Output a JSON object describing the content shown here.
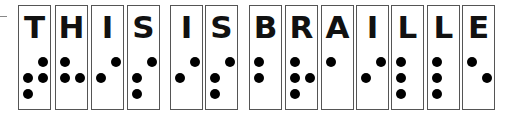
{
  "cells": [
    {
      "letter": "T",
      "left": 18,
      "dots": [
        2,
        3,
        4,
        5
      ]
    },
    {
      "letter": "H",
      "left": 55,
      "dots": [
        1,
        2,
        5
      ]
    },
    {
      "letter": "I",
      "left": 91,
      "dots": [
        2,
        4
      ]
    },
    {
      "letter": "S",
      "left": 127,
      "dots": [
        2,
        3,
        4
      ]
    },
    {
      "letter": "I",
      "left": 170,
      "dots": [
        2,
        4
      ]
    },
    {
      "letter": "S",
      "left": 205,
      "dots": [
        2,
        3,
        4
      ]
    },
    {
      "letter": "B",
      "left": 249,
      "dots": [
        1,
        2
      ]
    },
    {
      "letter": "R",
      "left": 285,
      "dots": [
        1,
        2,
        3,
        5
      ]
    },
    {
      "letter": "A",
      "left": 321,
      "dots": [
        1
      ]
    },
    {
      "letter": "I",
      "left": 356,
      "dots": [
        2,
        4
      ]
    },
    {
      "letter": "L",
      "left": 391,
      "dots": [
        1,
        2,
        3
      ]
    },
    {
      "letter": "L",
      "left": 427,
      "dots": [
        1,
        2,
        3
      ]
    },
    {
      "letter": "E",
      "left": 462,
      "dots": [
        1,
        5
      ]
    }
  ]
}
